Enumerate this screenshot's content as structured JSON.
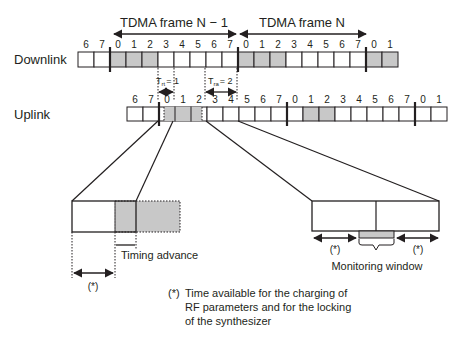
{
  "frames": {
    "prev_label": "TDMA frame N − 1",
    "next_label": "TDMA frame N"
  },
  "rows": {
    "downlink": {
      "label": "Downlink",
      "slots": [
        "6",
        "7",
        "0",
        "1",
        "2",
        "3",
        "4",
        "5",
        "6",
        "7",
        "0",
        "1",
        "2",
        "3",
        "4",
        "5",
        "6",
        "7",
        "0",
        "1"
      ],
      "shaded": [
        2,
        3,
        4,
        10,
        11,
        12,
        18,
        19
      ]
    },
    "uplink": {
      "label": "Uplink",
      "slots": [
        "6",
        "7",
        "0",
        "1",
        "2",
        "3",
        "4",
        "5",
        "6",
        "7",
        "0",
        "1",
        "2",
        "3",
        "4",
        "5",
        "6",
        "7",
        "0",
        "1"
      ],
      "shaded": [
        11,
        12
      ]
    }
  },
  "offsets": {
    "t_rx_tx": "T",
    "t_rx_tx_sub": "rt",
    "t_rx_tx_value": "= 1",
    "t_tx_rx": "T",
    "t_tx_rx_sub": "ra",
    "t_tx_rx_value": "= 2"
  },
  "details": {
    "timing_advance_label": "Timing advance",
    "monitoring_window_label": "Monitoring window",
    "star_marker": "(*)"
  },
  "footnote": {
    "marker": "(*)",
    "lines": [
      "Time available for the charging of",
      "RF parameters and for the locking",
      "of the synthesizer"
    ]
  },
  "colors": {
    "line": "#231f20",
    "shade": "#c8c8c8",
    "background": "#ffffff"
  }
}
